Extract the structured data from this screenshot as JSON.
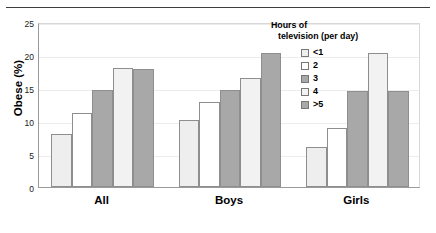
{
  "chart_data": {
    "type": "bar",
    "title": "",
    "xlabel": "",
    "ylabel": "Obese (%)",
    "categories": [
      "All",
      "Boys",
      "Girls"
    ],
    "ylim": [
      0,
      25
    ],
    "yticks": [
      0,
      5,
      10,
      15,
      20,
      25
    ],
    "ytick_labels": [
      "0",
      "5",
      "10",
      "15",
      "20",
      "25"
    ],
    "grid": true,
    "legend_position": "top-right",
    "legend_title_line1": "Hours of",
    "legend_title_line2": "television (per day)",
    "series": [
      {
        "name": "<1",
        "values": [
          8.0,
          10.1,
          6.0
        ],
        "color": "#eeeeee"
      },
      {
        "name": "2",
        "values": [
          11.2,
          12.9,
          9.0
        ],
        "color": "#ffffff"
      },
      {
        "name": "3",
        "values": [
          14.7,
          14.7,
          14.5
        ],
        "color": "#a8a8a8"
      },
      {
        "name": "4",
        "values": [
          18.0,
          16.5,
          20.3
        ],
        "color": "#f2f2f2"
      },
      {
        "name": ">5",
        "values": [
          17.9,
          20.3,
          14.5
        ],
        "color": "#a8a8a8"
      }
    ]
  }
}
